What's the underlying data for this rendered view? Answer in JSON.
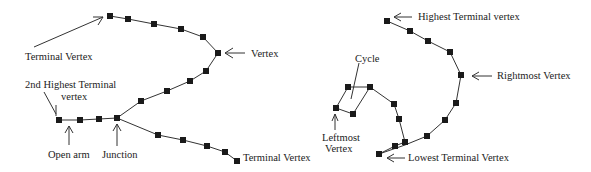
{
  "figure": {
    "left_graph": {
      "labels": {
        "terminal_top": "Terminal Vertex",
        "vertex": "Vertex",
        "second_highest_line1": "2nd Highest Terminal",
        "second_highest_line2": "vertex",
        "open_arm": "Open arm",
        "junction": "Junction",
        "terminal_bottom": "Terminal Vertex"
      },
      "vertices": [
        [
          110,
          16
        ],
        [
          128,
          19
        ],
        [
          154,
          24
        ],
        [
          181,
          29
        ],
        [
          203,
          37
        ],
        [
          218,
          53
        ],
        [
          206,
          71
        ],
        [
          190,
          81
        ],
        [
          167,
          91
        ],
        [
          141,
          101
        ],
        [
          117,
          118
        ],
        [
          59,
          120
        ],
        [
          80,
          120
        ],
        [
          99,
          119
        ],
        [
          158,
          135
        ],
        [
          183,
          140
        ],
        [
          207,
          146
        ],
        [
          225,
          152
        ],
        [
          237,
          161
        ]
      ]
    },
    "right_graph": {
      "labels": {
        "highest": "Highest Terminal vertex",
        "rightmost": "Rightmost Vertex",
        "cycle": "Cycle",
        "leftmost_line1": "Leftmost",
        "leftmost_line2": "Vertex",
        "lowest": "Lowest Terminal Vertex"
      },
      "vertices": [
        [
          387,
          21
        ],
        [
          410,
          31
        ],
        [
          428,
          41
        ],
        [
          450,
          52
        ],
        [
          461,
          75
        ],
        [
          456,
          103
        ],
        [
          445,
          120
        ],
        [
          427,
          136
        ],
        [
          406,
          137
        ],
        [
          379,
          154
        ],
        [
          394,
          147
        ],
        [
          348,
          87
        ],
        [
          370,
          87
        ],
        [
          336,
          108
        ],
        [
          353,
          114
        ],
        [
          394,
          104
        ],
        [
          399,
          119
        ],
        [
          405,
          142
        ]
      ]
    }
  }
}
